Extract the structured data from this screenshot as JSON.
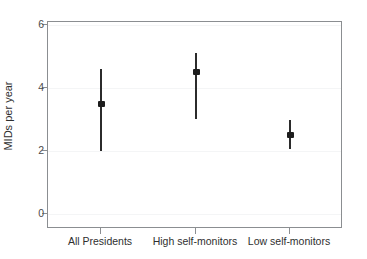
{
  "chart_data": {
    "type": "scatter",
    "title": "",
    "subtitle": "",
    "xlabel": "",
    "ylabel": "MIDs per year",
    "categories": [
      "All Presidents",
      "High self-monitors",
      "Low self-monitors"
    ],
    "ytick_labels": [
      "0",
      "2",
      "4",
      "6"
    ],
    "ytick_values": [
      0,
      2,
      4,
      6
    ],
    "ylim": [
      0,
      6.3
    ],
    "grid": true,
    "legend_position": "none",
    "annotations": [],
    "series": [
      {
        "name": "Point estimate with confidence interval",
        "point_color": "#1d1d1d",
        "line_color": "#2b2b2b",
        "points": [
          {
            "category": "All Presidents",
            "value": 3.5,
            "low": 2.0,
            "high": 4.6
          },
          {
            "category": "High self-monitors",
            "value": 4.5,
            "low": 3.0,
            "high": 5.1
          },
          {
            "category": "Low self-monitors",
            "value": 2.5,
            "low": 2.05,
            "high": 3.0
          }
        ]
      }
    ]
  },
  "axes": {
    "frame_color": "#8b8e91",
    "gridline_color": "#f4f5f6",
    "tick_color": "#8b8e91",
    "tick_label_color": "#4c4c4c",
    "axis_title_color": "#2f2f2f"
  }
}
